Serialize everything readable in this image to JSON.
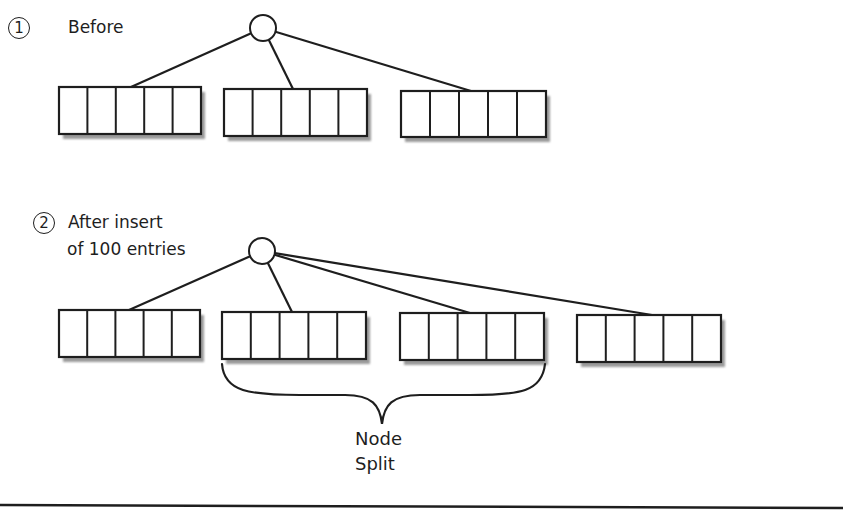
{
  "diagram": {
    "step1": {
      "number": "1",
      "label": "Before"
    },
    "step2": {
      "number": "2",
      "label_line1": "After insert",
      "label_line2": "of 100 entries"
    },
    "brace_label_line1": "Node",
    "brace_label_line2": "Split",
    "colors": {
      "stroke": "#1e1e1e",
      "shadow": "#9a9a9a",
      "fill": "#ffffff"
    },
    "before": {
      "root": {
        "cx": 263,
        "cy": 28,
        "r": 13
      },
      "nodes": [
        {
          "x": 59,
          "y": 87,
          "w": 142,
          "h": 47,
          "slots": 5,
          "link_x": 131
        },
        {
          "x": 224,
          "y": 89,
          "w": 143,
          "h": 47,
          "slots": 5,
          "link_x": 293
        },
        {
          "x": 401,
          "y": 91,
          "w": 145,
          "h": 46,
          "slots": 5,
          "link_x": 471
        }
      ]
    },
    "after": {
      "root": {
        "cx": 262,
        "cy": 251,
        "r": 13
      },
      "nodes": [
        {
          "x": 59,
          "y": 310,
          "w": 141,
          "h": 47,
          "slots": 5,
          "link_x": 129
        },
        {
          "x": 222,
          "y": 312,
          "w": 144,
          "h": 47,
          "slots": 5,
          "link_x": 292
        },
        {
          "x": 400,
          "y": 313,
          "w": 144,
          "h": 47,
          "slots": 5,
          "link_x": 470
        },
        {
          "x": 577,
          "y": 315,
          "w": 144,
          "h": 47,
          "slots": 5,
          "link_x": 652
        }
      ]
    }
  }
}
